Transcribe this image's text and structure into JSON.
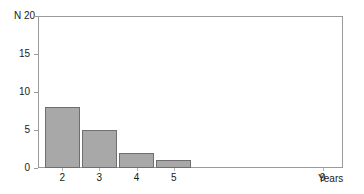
{
  "chart_data": {
    "type": "bar",
    "title": "",
    "subtitle": "",
    "xlabel": "Years",
    "ylabel": "N",
    "categories": [
      "2",
      "3",
      "4",
      "5"
    ],
    "values": [
      8,
      5,
      2,
      1
    ],
    "series": [
      {
        "name": "N",
        "values": [
          8,
          5,
          2,
          1
        ]
      }
    ],
    "ylim": [
      0,
      20
    ],
    "ytick_labels": [
      "20",
      "15",
      "10",
      "5",
      "0"
    ],
    "ytick_values": [
      20,
      15,
      10,
      5,
      0
    ],
    "xtick_labels": [
      "2",
      "3",
      "4",
      "5",
      "9"
    ],
    "xtick_values": [
      2,
      3,
      4,
      5,
      9
    ],
    "xlim": [
      1.35,
      9.55
    ],
    "grid": false,
    "legend": false,
    "legend_position": "none",
    "bar_fill_color": "#a8a8a8",
    "bar_border_color": "#6f6f6f",
    "frame_color": "#9a9a9a",
    "background_color": "#ffffff",
    "text_color": "#1a1a1a"
  }
}
